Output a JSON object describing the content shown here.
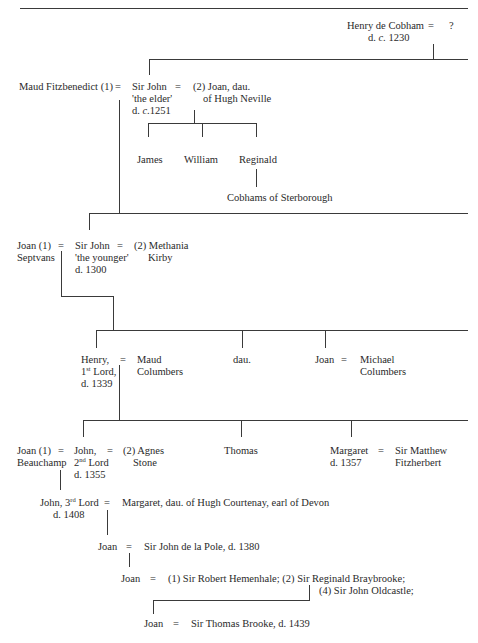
{
  "header": {
    "running_title_cutoff": "... Cobham ..."
  },
  "tree": {
    "gen1": {
      "person": "Henry de Cobham",
      "death": "d. c. 1230",
      "eq": "=",
      "spouse": "?"
    },
    "gen2": {
      "wife1": "Maud Fitzbenedict (1)",
      "eq1": "=",
      "person_line1": "Sir John",
      "person_line2": "'the elder'",
      "person_line3": "d. c.1251",
      "eq2": "=",
      "wife2_line1": "(2) Joan, dau.",
      "wife2_line2": "of Hugh Neville",
      "children": [
        "James",
        "William",
        "Reginald"
      ],
      "reginald_descendants": "Cobhams of Sterborough"
    },
    "gen3": {
      "wife1_line1": "Joan (1)",
      "wife1_line2": "Septvans",
      "eq1": "=",
      "person_line1": "Sir John",
      "person_line2": "'the younger'",
      "person_line3": "d. 1300",
      "eq2": "=",
      "wife2_line1": "(2) Methania",
      "wife2_line2": "Kirby"
    },
    "gen4": {
      "henry_line1": "Henry,",
      "henry_ordinal": "1",
      "henry_sup": "st",
      "henry_line2_rest": " Lord,",
      "henry_line3": "d. 1339",
      "eq1": "=",
      "spouse_line1": "Maud",
      "spouse_line2": "Columbers",
      "dau": "dau.",
      "joan": "Joan",
      "eq2": "=",
      "joan_spouse_line1": "Michael",
      "joan_spouse_line2": "Columbers"
    },
    "gen5": {
      "wife1_line1": "Joan (1)",
      "wife1_line2": "Beauchamp",
      "eq1": "=",
      "john_line1": "John,",
      "john_ordinal": "2",
      "john_sup": "nd",
      "john_line2_rest": " Lord",
      "john_line3": "d. 1355",
      "eq2": "=",
      "wife2_line1": "(2) Agnes",
      "wife2_line2": "Stone",
      "thomas": "Thomas",
      "margaret_line1": "Margaret",
      "margaret_line2": "d. 1357",
      "eq3": "=",
      "margaret_spouse_line1": "Sir Matthew",
      "margaret_spouse_line2": "Fitzherbert"
    },
    "gen6": {
      "john_prefix": "John, ",
      "john_ordinal": "3",
      "john_sup": "rd",
      "john_rest": " Lord",
      "john_death": "d. 1408",
      "eq": "=",
      "spouse": "Margaret, dau. of Hugh Courtenay, earl of Devon"
    },
    "gen7": {
      "person": "Joan",
      "eq": "=",
      "spouse": "Sir John de la Pole, d. 1380"
    },
    "gen8": {
      "person": "Joan",
      "eq": "=",
      "spouses_line1": "(1) Sir Robert Hemenhale; (2) Sir Reginald Braybrooke;",
      "spouses_line2": "(4) Sir John Oldcastle;"
    },
    "gen9": {
      "person": "Joan",
      "eq": "=",
      "spouse": "Sir Thomas Brooke, d. 1439"
    }
  }
}
